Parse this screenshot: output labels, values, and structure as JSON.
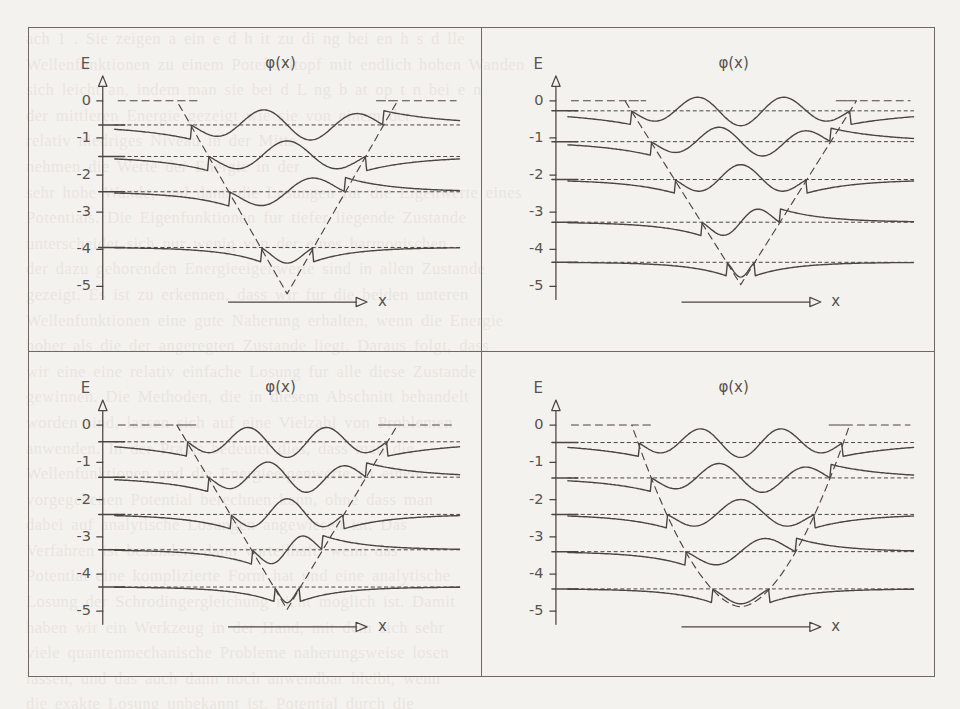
{
  "figure": {
    "background_color": "#f4f2ee",
    "ink_color": "#4a4642",
    "frame_color": "#6d6a66",
    "bleed_text": "ach 1 . Sie zeigen a ein e d h it zu di ng bei en h s d lle\nWellenfunktionen zu einem Potentialtopf mit endlich hohen Wanden\nsich leicht an, indem man sie bei d L ng b at op t n bei e n\nder mittleren Energie gezeigt wie sie von einem der\nrelativ niedriges Niveau in der Mitte\nnehmen die Werte der Energie in der\nsehr hohe Wande, und dann die Losungen fur die Eigenwerte eines\nPotentials. Die Eigenfunktionen fur tiefer liegende Zustande\nunterscheidet sich nur wenig von der eines harmonischen\nder dazu gehorenden Energieeigenwerte sind in allen Zustande\ngezeigt. Es ist zu erkennen, dass wir fur die beiden unteren\nWellenfunktionen eine gute Naherung erhalten, wenn die Energie\nhoher als die der angeregten Zustande liegt. Daraus folgt, dass\nwir eine eine relativ einfache Losung fur alle diese Zustande\ngewinnen. Die Methoden, die in diesem Abschnitt behandelt\nworden sind, lassen sich auf eine Vielzahl von Problemen\nanwenden. In der Praxis bedeutet dies, dass man die\nWellenfunktionen und die Energieeigenwerte zu einem\nvorgegebenen Potential berechnen kann, ohne dass man\ndabei auf analytische Losungen angewiesen ist. Das\nVerfahren ist besonders dann vorteilhaft, wenn das\nPotential eine komplizierte Form hat und eine analytische\nLosung der Schrodingergleichung nicht moglich ist. Damit\nhaben wir ein Werkzeug in der Hand, mit dem sich sehr\nviele quantenmechanische Probleme naherungsweise losen\nlassen, und das auch dann noch anwendbar bleibt, wenn\ndie exakte Losung unbekannt ist. Potential durch die\nLosung der linearen ist."
  },
  "axes": {
    "e_axis_label": "E",
    "wave_label": "φ(x)",
    "x_axis_label": "x",
    "y_ticks": [
      "0",
      "-1",
      "-2",
      "-3",
      "-4",
      "-5"
    ],
    "y_tick_values": [
      0,
      -1,
      -2,
      -3,
      -4,
      -5
    ],
    "y_range": [
      -5.45,
      0.35
    ]
  },
  "chart_data": {
    "type": "line",
    "title": "",
    "xlabel": "x",
    "ylabel": "E",
    "grid": false,
    "legend": "none",
    "panels": [
      {
        "id": "top-left",
        "position": "top-left",
        "potential": {
          "style": "dashed",
          "shape": "v-shaped-narrow",
          "top_value": 0,
          "bottom_value": -5.2,
          "left_wall_x": 0.18,
          "right_wall_x": 0.82,
          "flat_top_left_end": 0.245,
          "flat_top_right_start": 0.755,
          "vertex_x": 0.5
        },
        "levels": [
          -0.65,
          -1.5,
          -2.45,
          -3.95
        ],
        "level_count": 4,
        "states": [
          {
            "n": 4,
            "energy": -0.65,
            "nodes": 3,
            "amplitude": 0.42
          },
          {
            "n": 3,
            "energy": -1.5,
            "nodes": 2,
            "amplitude": 0.42
          },
          {
            "n": 2,
            "energy": -2.45,
            "nodes": 1,
            "amplitude": 0.42
          },
          {
            "n": 1,
            "energy": -3.95,
            "nodes": 0,
            "amplitude": 0.42
          }
        ]
      },
      {
        "id": "top-right",
        "position": "top-right",
        "potential": {
          "style": "dashed",
          "shape": "v-shaped",
          "top_value": 0,
          "bottom_value": -4.95,
          "left_wall_x": 0.165,
          "right_wall_x": 0.835,
          "flat_top_left_end": 0.225,
          "flat_top_right_start": 0.775,
          "vertex_x": 0.5
        },
        "levels": [
          -0.27,
          -1.1,
          -2.12,
          -3.27,
          -4.35
        ],
        "level_count": 5,
        "states": [
          {
            "n": 5,
            "energy": -0.27,
            "nodes": 4,
            "amplitude": 0.4
          },
          {
            "n": 4,
            "energy": -1.1,
            "nodes": 3,
            "amplitude": 0.4
          },
          {
            "n": 3,
            "energy": -2.12,
            "nodes": 2,
            "amplitude": 0.4
          },
          {
            "n": 2,
            "energy": -3.27,
            "nodes": 1,
            "amplitude": 0.4
          },
          {
            "n": 1,
            "energy": -4.35,
            "nodes": 0,
            "amplitude": 0.4
          }
        ]
      },
      {
        "id": "bottom-left",
        "position": "bottom-left",
        "potential": {
          "style": "dashed",
          "shape": "v-shaped",
          "top_value": 0,
          "bottom_value": -4.95,
          "left_wall_x": 0.18,
          "right_wall_x": 0.82,
          "flat_top_left_end": 0.235,
          "flat_top_right_start": 0.765,
          "vertex_x": 0.5
        },
        "levels": [
          -0.45,
          -1.4,
          -2.4,
          -3.35,
          -4.35
        ],
        "level_count": 5,
        "states": [
          {
            "n": 5,
            "energy": -0.45,
            "nodes": 4,
            "amplitude": 0.42
          },
          {
            "n": 4,
            "energy": -1.4,
            "nodes": 3,
            "amplitude": 0.42
          },
          {
            "n": 3,
            "energy": -2.4,
            "nodes": 2,
            "amplitude": 0.42
          },
          {
            "n": 2,
            "energy": -3.35,
            "nodes": 1,
            "amplitude": 0.42
          },
          {
            "n": 1,
            "energy": -4.35,
            "nodes": 0,
            "amplitude": 0.42
          }
        ]
      },
      {
        "id": "bottom-right",
        "position": "bottom-right",
        "potential": {
          "style": "dashed",
          "shape": "rounded-bottom",
          "top_value": 0,
          "bottom_value": -4.88,
          "left_wall_x": 0.185,
          "right_wall_x": 0.815,
          "flat_top_left_end": 0.245,
          "flat_top_right_start": 0.755,
          "vertex_x": 0.5
        },
        "levels": [
          -0.47,
          -1.42,
          -2.4,
          -3.4,
          -4.4
        ],
        "level_count": 5,
        "states": [
          {
            "n": 5,
            "energy": -0.47,
            "nodes": 4,
            "amplitude": 0.4
          },
          {
            "n": 4,
            "energy": -1.42,
            "nodes": 3,
            "amplitude": 0.4
          },
          {
            "n": 3,
            "energy": -2.4,
            "nodes": 2,
            "amplitude": 0.4
          },
          {
            "n": 2,
            "energy": -3.4,
            "nodes": 1,
            "amplitude": 0.4
          },
          {
            "n": 1,
            "energy": -4.4,
            "nodes": 0,
            "amplitude": 0.4
          }
        ]
      }
    ]
  }
}
